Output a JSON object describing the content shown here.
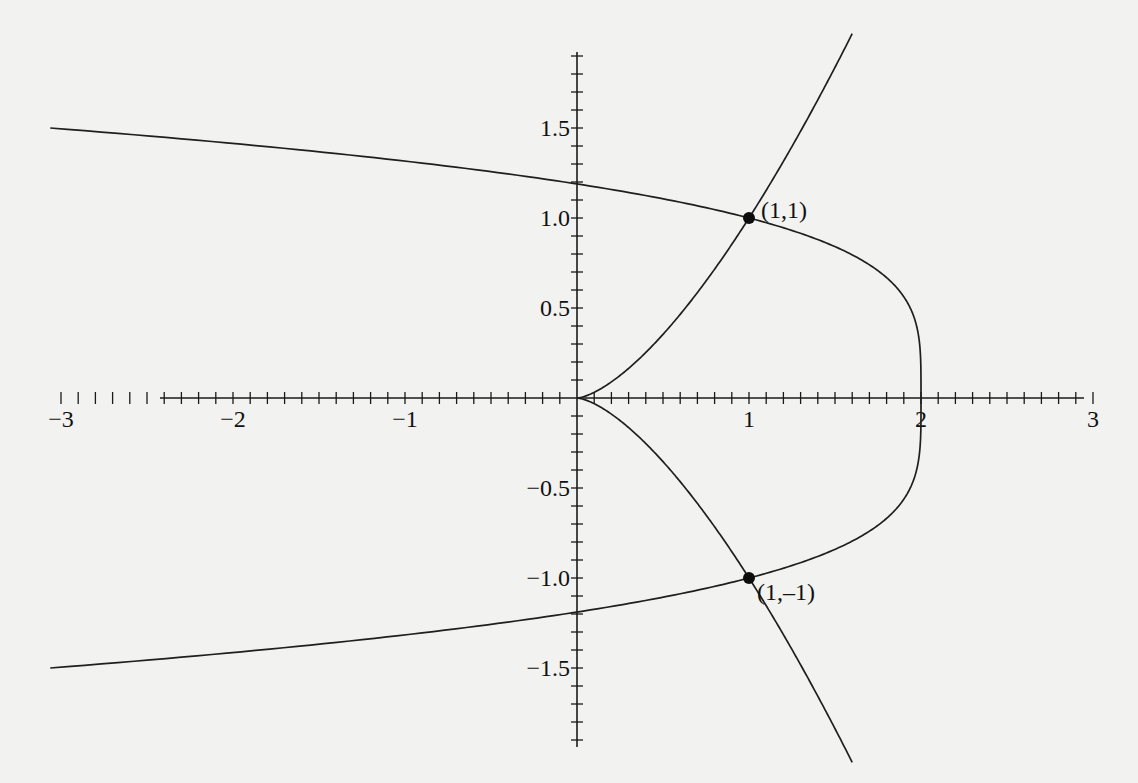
{
  "chart_data": {
    "type": "line",
    "title": "",
    "xlabel": "",
    "ylabel": "",
    "xlim": [
      -3,
      3
    ],
    "ylim": [
      -1.9,
      1.9
    ],
    "grid": false,
    "legend": null,
    "x_ticks": {
      "major": [
        -3,
        -2,
        -1,
        1,
        2,
        3
      ],
      "labels": [
        "−3",
        "−2",
        "−1",
        "1",
        "2",
        "3"
      ],
      "minor_step": 0.1
    },
    "y_ticks": {
      "major": [
        -1.5,
        -1.0,
        -0.5,
        0.5,
        1.0,
        1.5
      ],
      "labels": [
        "−1.5",
        "−1.0",
        "−0.5",
        "0.5",
        "1.0",
        "1.5"
      ],
      "minor_step": 0.1
    },
    "series": [
      {
        "name": "cusp curve (y^2 = x^3)",
        "equation": "y^2 = x^3",
        "x_range": [
          0,
          1.6
        ],
        "points": [
          [
            0,
            0
          ],
          [
            0.25,
            0.125
          ],
          [
            0.5,
            0.354
          ],
          [
            0.75,
            0.65
          ],
          [
            1,
            1
          ],
          [
            1.25,
            1.398
          ],
          [
            1.5,
            1.837
          ],
          [
            1.6,
            2.02
          ],
          [
            0.25,
            -0.125
          ],
          [
            0.5,
            -0.354
          ],
          [
            0.75,
            -0.65
          ],
          [
            1,
            -1
          ],
          [
            1.25,
            -1.398
          ],
          [
            1.5,
            -1.837
          ],
          [
            1.6,
            -2.02
          ]
        ]
      },
      {
        "name": "quartic curve (x = 2 - y^4)",
        "equation": "x = 2 - y^4",
        "y_range": [
          -1.5,
          1.5
        ],
        "points": [
          [
            -3.06,
            1.5
          ],
          [
            -0.07,
            1.2
          ],
          [
            1,
            1
          ],
          [
            1.59,
            0.8
          ],
          [
            1.87,
            0.6
          ],
          [
            1.98,
            0.4
          ],
          [
            2,
            0
          ],
          [
            1.98,
            -0.4
          ],
          [
            1.87,
            -0.6
          ],
          [
            1.59,
            -0.8
          ],
          [
            1,
            -1
          ],
          [
            -0.07,
            -1.2
          ],
          [
            -3.06,
            -1.5
          ]
        ]
      }
    ],
    "annotations": [
      {
        "point": [
          1,
          1
        ],
        "label": "(1,1)"
      },
      {
        "point": [
          1,
          -1
        ],
        "label": "(1,–1)"
      }
    ]
  },
  "layout": {
    "origin_px": [
      577,
      398
    ],
    "px_per_unit_x": 172,
    "px_per_unit_y": 180,
    "x_axis_px": [
      160,
      1084
    ],
    "y_axis_px": [
      52,
      747
    ]
  }
}
